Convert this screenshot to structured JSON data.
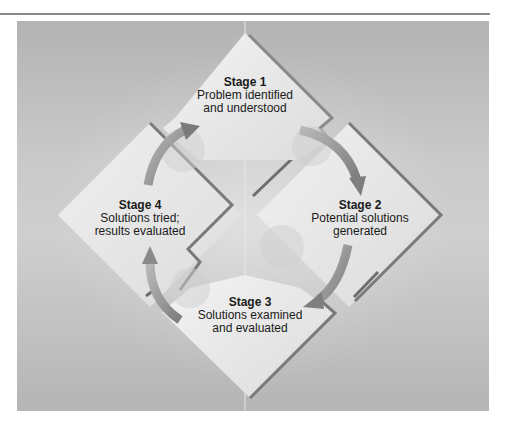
{
  "diagram": {
    "type": "cycle",
    "stages": [
      {
        "id": 1,
        "title": "Stage 1",
        "line1": "Problem identified",
        "line2": "and understood"
      },
      {
        "id": 2,
        "title": "Stage 2",
        "line1": "Potential solutions",
        "line2": "generated"
      },
      {
        "id": 3,
        "title": "Stage 3",
        "line1": "Solutions examined",
        "line2": "and evaluated"
      },
      {
        "id": 4,
        "title": "Stage 4",
        "line1": "Solutions tried;",
        "line2": "results evaluated"
      }
    ],
    "flow": [
      "Stage 1 -> Stage 2",
      "Stage 2 -> Stage 3",
      "Stage 3 -> Stage 4",
      "Stage 4 -> Stage 1"
    ],
    "colors": {
      "background": "#c4c4c4",
      "diamond_fill": "#ececec",
      "diamond_edge": "#7a7a7a",
      "arrow": "#8c8c8c",
      "text": "#1a1a1a"
    }
  }
}
